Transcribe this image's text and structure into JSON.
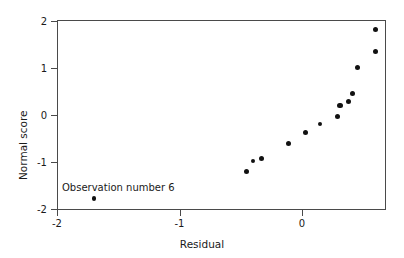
{
  "chart_data": {
    "type": "scatter",
    "title": "",
    "subtitle": "",
    "xlabel": "Residual",
    "ylabel": "Normal score",
    "xlim": [
      -2.0,
      0.685
    ],
    "ylim": [
      -2.04,
      2.0
    ],
    "grid": false,
    "legend": null,
    "x_ticks": [
      -2,
      -1,
      0
    ],
    "x_tick_labels": [
      "-2",
      "-1",
      "0"
    ],
    "y_ticks": [
      2,
      1,
      0,
      -1,
      -2
    ],
    "y_tick_labels": [
      "2",
      "1",
      "0",
      "-1",
      "-2"
    ],
    "marker": "filled-circle",
    "marker_color": "#111111",
    "points": [
      {
        "x": -1.7,
        "y": -1.77,
        "label": "Observation number 6"
      },
      {
        "x": -0.45,
        "y": -1.19,
        "label": ""
      },
      {
        "x": -0.4,
        "y": -0.98,
        "label": ""
      },
      {
        "x": -0.33,
        "y": -0.92,
        "label": ""
      },
      {
        "x": -0.11,
        "y": -0.6,
        "label": ""
      },
      {
        "x": 0.03,
        "y": -0.36,
        "label": ""
      },
      {
        "x": 0.15,
        "y": -0.19,
        "label": ""
      },
      {
        "x": 0.29,
        "y": -0.02,
        "label": ""
      },
      {
        "x": 0.31,
        "y": 0.21,
        "label": ""
      },
      {
        "x": 0.38,
        "y": 0.3,
        "label": ""
      },
      {
        "x": 0.41,
        "y": 0.47,
        "label": ""
      },
      {
        "x": 0.45,
        "y": 1.02,
        "label": ""
      },
      {
        "x": 0.6,
        "y": 1.36,
        "label": ""
      },
      {
        "x": 0.6,
        "y": 1.83,
        "label": ""
      }
    ],
    "annotations": [
      {
        "text": "Observation number 6",
        "x": -1.95,
        "y": -1.48
      }
    ]
  },
  "colors": {
    "axis": "#4a4a4a",
    "text": "#1a1a1a",
    "marker": "#111111",
    "background": "#ffffff"
  }
}
